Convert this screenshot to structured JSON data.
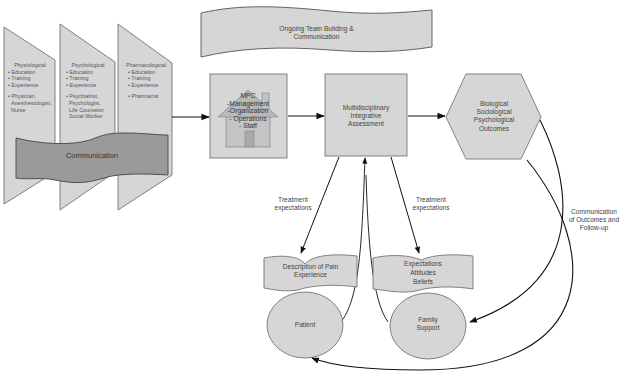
{
  "colors": {
    "shape_fill": "#d6d6d6",
    "comm_banner_fill": "#9a9a9a",
    "stroke": "#555555",
    "arrow": "#111111",
    "text": "#444444"
  },
  "panels": [
    {
      "title": "Physiological",
      "items": [
        "• Education",
        "• Training",
        "• Experience"
      ],
      "roles": [
        "• Physician,",
        "Anesthesiologist,",
        "Nurse"
      ]
    },
    {
      "title": "Psychological",
      "items": [
        "• Education",
        "• Training",
        "• Experience"
      ],
      "roles": [
        "• Psychiatrist,",
        "Psychologist,",
        "Life Counselor,",
        "Social Worker"
      ]
    },
    {
      "title": "Pharmacological",
      "items": [
        "• Education",
        "• Training",
        "• Experience"
      ],
      "roles": [
        "• Pharmacist"
      ]
    }
  ],
  "communication_banner": "Communication",
  "team_banner": {
    "line1": "Ongoing Team Building &",
    "line2": "Communication"
  },
  "mpc": {
    "lines": [
      "MPC",
      "-Management",
      "-Organization",
      "- Operations",
      "- Staff"
    ]
  },
  "assessment": {
    "lines": [
      "Multidisciplinary",
      "Integrative",
      "Assessment"
    ]
  },
  "outcomes": {
    "lines": [
      "Biological",
      "Sociological",
      "Psychological",
      "Outcomes"
    ]
  },
  "treatment_left": {
    "line1": "Treatment",
    "line2": "expectations"
  },
  "treatment_right": {
    "line1": "Treatment",
    "line2": "expectations"
  },
  "pain_banner": {
    "line1": "Description of Pain",
    "line2": "Experience"
  },
  "beliefs_banner": {
    "lines": [
      "Expectations",
      "Attitudes",
      "Beliefs"
    ]
  },
  "patient": "Patient",
  "family": {
    "line1": "Family",
    "line2": "Support"
  },
  "followup": {
    "lines": [
      "Communication",
      "of Outcomes and",
      "Follow-up"
    ]
  }
}
